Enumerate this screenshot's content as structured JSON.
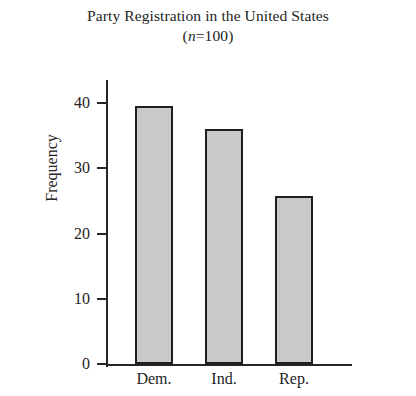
{
  "chart_data": {
    "type": "bar",
    "title": "Party Registration in the United States",
    "subtitle": "(n=100)",
    "subtitle_italic_part": "n",
    "subtitle_rest": "=100)",
    "subtitle_open": "(",
    "categories": [
      "Dem.",
      "Ind.",
      "Rep."
    ],
    "values": [
      39.5,
      36,
      25.7
    ],
    "xlabel": "",
    "ylabel": "Frequency",
    "ylim": [
      0,
      45
    ],
    "yticks": [
      0,
      10,
      20,
      30,
      40
    ],
    "ytick_labels": [
      "0",
      "10",
      "20",
      "30",
      "40"
    ],
    "grid": false,
    "legend": false,
    "bar_fill_color": "#c9c9c9",
    "bar_edge_color": "#1f1f1f",
    "axis_color": "#262626",
    "text_color": "#242424",
    "background_color": "#ffffff"
  }
}
